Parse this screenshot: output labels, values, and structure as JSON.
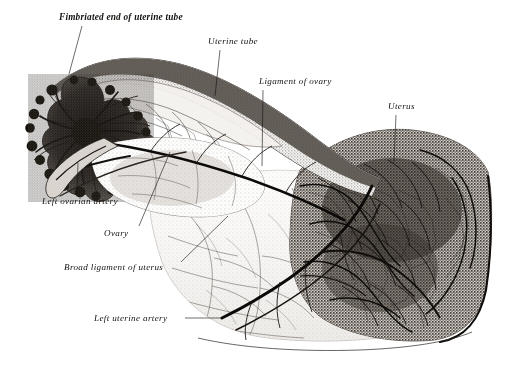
{
  "figure": {
    "kind": "anatomical-illustration",
    "style": "engraving, black-and-white halftone",
    "background_color": "#ffffff",
    "ink_color": "#15120f"
  },
  "labels": [
    {
      "id": "fimbriated-end",
      "text": "Fimbriated end of uterine tube",
      "x": 59,
      "y": 12,
      "bold": true,
      "leader": {
        "type": "line",
        "x1": 82,
        "y1": 26,
        "x2": 69,
        "y2": 74
      }
    },
    {
      "id": "uterine-tube",
      "text": "Uterine tube",
      "x": 208,
      "y": 36,
      "bold": false,
      "leader": {
        "type": "line",
        "x1": 220,
        "y1": 50,
        "x2": 215,
        "y2": 96
      }
    },
    {
      "id": "ligament-ovary",
      "text": "Ligament of ovary",
      "x": 259,
      "y": 76,
      "bold": false,
      "leader": {
        "type": "line",
        "x1": 263,
        "y1": 90,
        "x2": 262,
        "y2": 166
      }
    },
    {
      "id": "uterus",
      "text": "Uterus",
      "x": 388,
      "y": 101,
      "bold": false,
      "leader": {
        "type": "line",
        "x1": 396,
        "y1": 115,
        "x2": 394,
        "y2": 162
      }
    },
    {
      "id": "left-ovarian-artery",
      "text": "Left ovarian artery",
      "x": 42,
      "y": 196,
      "bold": false,
      "leader": {
        "type": "line",
        "x1": 77,
        "y1": 195,
        "x2": 78,
        "y2": 163
      }
    },
    {
      "id": "ovary",
      "text": "Ovary",
      "x": 104,
      "y": 228,
      "bold": false,
      "leader": {
        "type": "line",
        "x1": 139,
        "y1": 226,
        "x2": 170,
        "y2": 152
      }
    },
    {
      "id": "broad-ligament",
      "text": "Broad ligament of uterus",
      "x": 64,
      "y": 262,
      "bold": false,
      "leader": {
        "type": "line",
        "x1": 181,
        "y1": 262,
        "x2": 228,
        "y2": 216
      }
    },
    {
      "id": "left-uterine-artery",
      "text": "Left uterine artery",
      "x": 94,
      "y": 313,
      "bold": false,
      "leader": {
        "type": "line",
        "x1": 185,
        "y1": 318,
        "x2": 222,
        "y2": 318
      }
    }
  ],
  "structures": [
    {
      "id": "fimbriated-end-mass",
      "name": "Fimbriated end of uterine tube",
      "tone": "very-dark",
      "note": "dense radiating tuft of vessels at far left"
    },
    {
      "id": "uterine-tube-band",
      "name": "Uterine tube",
      "tone": "mid-gray",
      "note": "sinuous band arcing from upper left to the uterus"
    },
    {
      "id": "ovary-body",
      "name": "Ovary",
      "tone": "light-stippled",
      "note": "oval stippled body below the tube"
    },
    {
      "id": "broad-ligament-sheet",
      "name": "Broad ligament of uterus",
      "tone": "pale",
      "note": "large translucent fan filling the lower middle"
    },
    {
      "id": "uterus-body",
      "name": "Uterus",
      "tone": "dark-dense",
      "note": "densely vascularised mass on the right"
    },
    {
      "id": "ovarian-artery-trunk",
      "name": "Left ovarian artery",
      "tone": "black-line",
      "note": "bold artery running along the upper border"
    },
    {
      "id": "uterine-artery-trunk",
      "name": "Left uterine artery",
      "tone": "black-line",
      "note": "bold artery ascending from the lower right"
    }
  ]
}
